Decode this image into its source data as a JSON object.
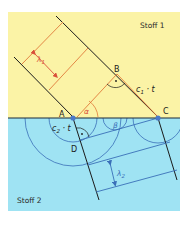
{
  "diagram": {
    "media": [
      {
        "id": "stoff1",
        "label": "Stoff 1",
        "color": "#fbf3a6"
      },
      {
        "id": "stoff2",
        "label": "Stoff 2",
        "color": "#9fe3f3"
      }
    ],
    "points": {
      "A": "A",
      "B": "B",
      "C": "C",
      "D": "D"
    },
    "labels": {
      "lambda1": "λ",
      "lambda1_sub": "1",
      "lambda2": "λ",
      "lambda2_sub": "2",
      "alpha": "α",
      "beta": "β",
      "c1t": "c",
      "c1t_sub": "1",
      "c1t_suffix": " · t",
      "c2t": "c",
      "c2t_sub": "2",
      "c2t_suffix": " · t"
    },
    "colors": {
      "interface": "#1d2b3a",
      "wavefront": "#1a1a1a",
      "ray_incident": "#e07a3a",
      "ray_refracted": "#3a6fb8",
      "point_marker": "#4a78c8",
      "angle_arc_alpha": "#e07a3a",
      "angle_arc_beta": "#3a6fb8"
    }
  }
}
